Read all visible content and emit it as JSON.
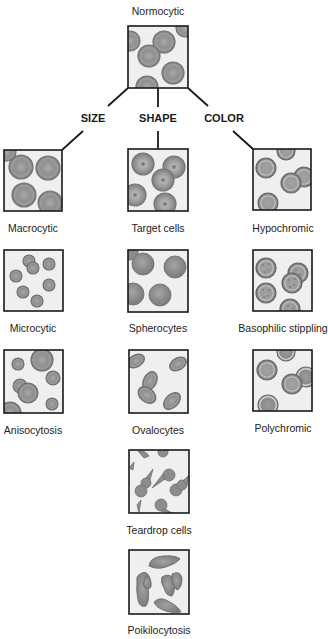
{
  "diagram": {
    "root": {
      "label": "Normocytic",
      "box": [
        128,
        26,
        60,
        62
      ]
    },
    "categories": [
      {
        "label": "SIZE",
        "x": 93,
        "y": 122
      },
      {
        "label": "SHAPE",
        "x": 158,
        "y": 122
      },
      {
        "label": "COLOR",
        "x": 224,
        "y": 122
      }
    ],
    "columns": {
      "size": [
        {
          "label": "Macrocytic",
          "box": [
            4,
            150,
            58,
            61
          ]
        },
        {
          "label": "Microcytic",
          "box": [
            4,
            250,
            59,
            61
          ]
        },
        {
          "label": "Anisocytosis",
          "box": [
            4,
            350,
            59,
            63
          ]
        }
      ],
      "shape": [
        {
          "label": "Target cells",
          "box": [
            128,
            149,
            60,
            62
          ]
        },
        {
          "label": "Spherocytes",
          "box": [
            128,
            250,
            60,
            62
          ]
        },
        {
          "label": "Ovalocytes",
          "box": [
            129,
            350,
            59,
            63
          ]
        },
        {
          "label": "Teardrop cells",
          "box": [
            129,
            450,
            60,
            63
          ]
        },
        {
          "label": "Poikilocytosis",
          "box": [
            129,
            550,
            60,
            64
          ]
        }
      ],
      "color": [
        {
          "label": "Hypochromic",
          "box": [
            253,
            149,
            58,
            61
          ]
        },
        {
          "label": "Basophilic stippling",
          "box": [
            253,
            250,
            59,
            61
          ]
        },
        {
          "label": "Polychromic",
          "box": [
            253,
            350,
            59,
            61
          ]
        }
      ]
    },
    "colors": {
      "line": "#1a1a1a",
      "box_fill": "#efefef",
      "cell_rim": "#7a7a7a",
      "cell_fill": "#8e8e8e",
      "cell_light": "#b9b9b9"
    }
  }
}
